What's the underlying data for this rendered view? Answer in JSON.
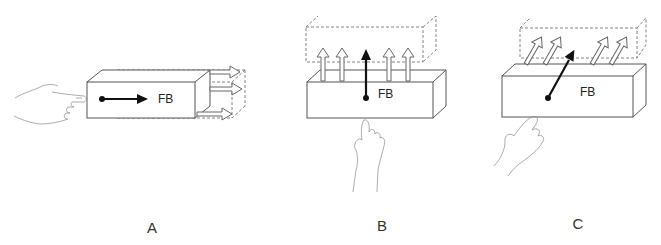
{
  "diagram": {
    "panels": [
      {
        "id": "A",
        "label": "A",
        "force_label": "FB",
        "direction": "horizontal-right",
        "hand_position": "left"
      },
      {
        "id": "B",
        "label": "B",
        "force_label": "FB",
        "direction": "vertical-up",
        "hand_position": "below"
      },
      {
        "id": "C",
        "label": "C",
        "force_label": "FB",
        "direction": "diagonal-up-right",
        "hand_position": "below-left"
      }
    ],
    "colors": {
      "line": "#555555",
      "dashed": "#666666",
      "force_arrow": "#111111",
      "hollow_arrow_fill": "#ffffff",
      "background": "#ffffff"
    }
  }
}
